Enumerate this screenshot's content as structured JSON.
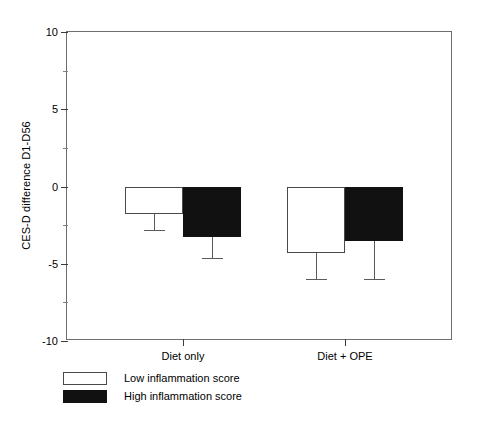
{
  "chart_data": {
    "type": "bar",
    "title": "",
    "xlabel": "",
    "ylabel": "CES-D difference D1-D56",
    "categories": [
      "Diet only",
      "Diet + OPE"
    ],
    "ylim": [
      -10,
      10
    ],
    "yticks": [
      10,
      5,
      0,
      -5,
      -10
    ],
    "ytick_labels": [
      "10",
      "5",
      "0",
      "-5",
      "-10"
    ],
    "yminor_ticks": [
      7.5,
      2.5,
      -2.5,
      -7.5
    ],
    "grid": false,
    "legend_position": "below-axes-left",
    "orientation": "vertical",
    "baseline": 0,
    "series": [
      {
        "name": "Low inflammation score",
        "color": "#ffffff",
        "edge_color": "#4a4a4a",
        "values": [
          -1.8,
          -4.3
        ],
        "errors_lower": [
          -2.8,
          -6.0
        ]
      },
      {
        "name": "High inflammation score",
        "color": "#111111",
        "edge_color": "#111111",
        "values": [
          -3.3,
          -3.5
        ],
        "errors_lower": [
          -4.6,
          -6.0
        ]
      }
    ]
  },
  "axis": {
    "y_label": "CES-D difference D1-D56",
    "y_ticks": [
      {
        "value": "10"
      },
      {
        "value": "5"
      },
      {
        "value": "0"
      },
      {
        "value": "-5"
      },
      {
        "value": "-10"
      }
    ],
    "x_ticks": [
      {
        "label": "Diet only"
      },
      {
        "label": "Diet + OPE"
      }
    ]
  },
  "legend": {
    "items": [
      {
        "label": "Low inflammation score",
        "swatch": "white"
      },
      {
        "label": "High inflammation score",
        "swatch": "black"
      }
    ]
  }
}
